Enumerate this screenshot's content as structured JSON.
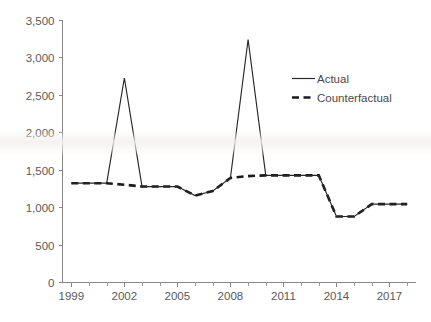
{
  "chart_data": {
    "type": "line",
    "title": "",
    "xlabel": "",
    "ylabel": "",
    "xlim": [
      1998.5,
      2018.5
    ],
    "ylim": [
      0,
      3500
    ],
    "grid": false,
    "legend_position": "inside-right",
    "x": [
      1999,
      2000,
      2001,
      2002,
      2003,
      2004,
      2005,
      2006,
      2007,
      2008,
      2009,
      2010,
      2011,
      2012,
      2013,
      2014,
      2015,
      2016,
      2017,
      2018
    ],
    "xticks": [
      1999,
      2002,
      2005,
      2008,
      2011,
      2014,
      2017
    ],
    "xtick_labels": [
      "1999",
      "2002",
      "2005",
      "2008",
      "2011",
      "2014",
      "2017"
    ],
    "yticks": [
      0,
      500,
      1000,
      1500,
      2000,
      2500,
      3000,
      3500
    ],
    "ytick_labels": [
      "0",
      "500",
      "1,000",
      "1,500",
      "2,000",
      "2,500",
      "3,000",
      "3,500"
    ],
    "series": [
      {
        "name": "Actual",
        "style": "solid",
        "color": "#262626",
        "values": [
          1320,
          1320,
          1320,
          2725,
          1275,
          1275,
          1275,
          1155,
          1215,
          1390,
          3240,
          1425,
          1425,
          1425,
          1425,
          875,
          875,
          1040,
          1040,
          1040
        ]
      },
      {
        "name": "Counterfactual",
        "style": "dashed",
        "color": "#1a1a1a",
        "values": [
          1320,
          1320,
          1320,
          1300,
          1275,
          1275,
          1275,
          1155,
          1215,
          1390,
          1415,
          1425,
          1425,
          1425,
          1425,
          875,
          875,
          1040,
          1040,
          1040
        ]
      }
    ],
    "legend": [
      {
        "label": "Actual",
        "style": "solid"
      },
      {
        "label": "Counterfactual",
        "style": "dashed"
      }
    ]
  }
}
